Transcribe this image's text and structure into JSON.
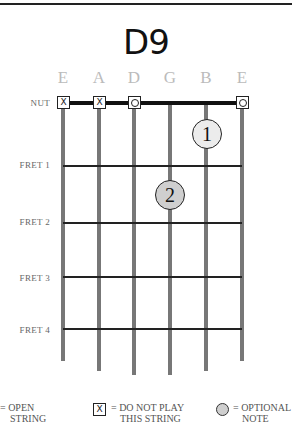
{
  "chord": {
    "title": "D9"
  },
  "strings": [
    {
      "name": "E",
      "x": 63,
      "bottom": 361,
      "marker": "x"
    },
    {
      "name": "A",
      "x": 99,
      "bottom": 371,
      "marker": "x"
    },
    {
      "name": "D",
      "x": 134,
      "bottom": 375,
      "marker": "o"
    },
    {
      "name": "G",
      "x": 170,
      "bottom": 375,
      "marker": ""
    },
    {
      "name": "B",
      "x": 206,
      "bottom": 371,
      "marker": ""
    },
    {
      "name": "E",
      "x": 242,
      "bottom": 361,
      "marker": "o"
    }
  ],
  "fret_labels": {
    "nut": "NUT",
    "fret1": "FRET 1",
    "fret2": "FRET 2",
    "fret3": "FRET 3",
    "fret4": "FRET 4"
  },
  "fingers": [
    {
      "label": "1",
      "string": "B",
      "position": "between nut and fret 1",
      "fill": "#ececec"
    },
    {
      "label": "2",
      "string": "G",
      "position": "between fret 1 and fret 2",
      "fill": "#cfcfcf"
    }
  ],
  "legend": {
    "open_line1": "= OPEN",
    "open_line2": "STRING",
    "mute_symbol": "X",
    "mute_line1": "= DO NOT PLAY",
    "mute_line2": "THIS STRING",
    "optional_line1": "= OPTIONAL",
    "optional_line2": "NOTE"
  },
  "colors": {
    "string": "#777777",
    "fret": "#222222",
    "string_name": "#bbbbbb",
    "optional_fill": "#cfcfcf"
  }
}
